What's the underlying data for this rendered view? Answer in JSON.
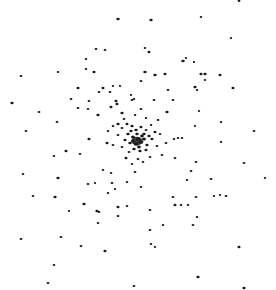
{
  "image": {
    "width": 276,
    "height": 290,
    "background": "#ffffff",
    "dot_color": "#1a1a1a",
    "description": "Star cluster, dense core near center"
  },
  "core": {
    "cx": 137,
    "cy": 141,
    "rx": 16,
    "ry": 12
  },
  "stars": [
    [
      118,
      19,
      1.6
    ],
    [
      96,
      49,
      1.3
    ],
    [
      105,
      50,
      1.3
    ],
    [
      86,
      59,
      1.2
    ],
    [
      86,
      69,
      1.2
    ],
    [
      94,
      72,
      1.4
    ],
    [
      21,
      76,
      1.3
    ],
    [
      58,
      72,
      1.2
    ],
    [
      78,
      88,
      1.4
    ],
    [
      103,
      88,
      1.4
    ],
    [
      113,
      86,
      1.1
    ],
    [
      120,
      86,
      1.1
    ],
    [
      71,
      99,
      1.3
    ],
    [
      89,
      101,
      1.3
    ],
    [
      99,
      92,
      1.3
    ],
    [
      110,
      92,
      1.3
    ],
    [
      116,
      101,
      1.4
    ],
    [
      12,
      103,
      1.5
    ],
    [
      39,
      112,
      1.3
    ],
    [
      88,
      109,
      1.2
    ],
    [
      78,
      108,
      1.3
    ],
    [
      98,
      115,
      1.5
    ],
    [
      117,
      104,
      1.4
    ],
    [
      111,
      107,
      1.4
    ],
    [
      122,
      113,
      1.5
    ],
    [
      57,
      122,
      1.3
    ],
    [
      26,
      131,
      1.3
    ],
    [
      118,
      124,
      1.5
    ],
    [
      89,
      139,
      1.4
    ],
    [
      107,
      143,
      1.4
    ],
    [
      132,
      100,
      1.3
    ],
    [
      134,
      99,
      1.2
    ],
    [
      131,
      95,
      1.1
    ],
    [
      239,
      1,
      1.3
    ],
    [
      151,
      20,
      1.5
    ],
    [
      201,
      17,
      1.2
    ],
    [
      231,
      38,
      1.1
    ],
    [
      145,
      48,
      1.2
    ],
    [
      149,
      52,
      1.4
    ],
    [
      183,
      61,
      1.6
    ],
    [
      186,
      58,
      1.1
    ],
    [
      194,
      62,
      1.1
    ],
    [
      145,
      72,
      1.6
    ],
    [
      155,
      75,
      1.6
    ],
    [
      165,
      74,
      1.4
    ],
    [
      201,
      74,
      1.4
    ],
    [
      205,
      74,
      1.5
    ],
    [
      220,
      75,
      1.4
    ],
    [
      205,
      80,
      1.1
    ],
    [
      195,
      87,
      1.5
    ],
    [
      197,
      90,
      1.2
    ],
    [
      233,
      88,
      1.4
    ],
    [
      141,
      81,
      1.3
    ],
    [
      168,
      90,
      1.3
    ],
    [
      154,
      100,
      1.3
    ],
    [
      173,
      100,
      1.3
    ],
    [
      167,
      112,
      1.5
    ],
    [
      199,
      111,
      1.1
    ],
    [
      221,
      122,
      1.2
    ],
    [
      195,
      126,
      1.1
    ],
    [
      254,
      131,
      1.3
    ],
    [
      221,
      142,
      1.2
    ],
    [
      174,
      139,
      1.2
    ],
    [
      178,
      138,
      1.2
    ],
    [
      182,
      138,
      1.2
    ],
    [
      141,
      109,
      1.3
    ],
    [
      66,
      151,
      1.4
    ],
    [
      54,
      156,
      1.2
    ],
    [
      80,
      154,
      1.2
    ],
    [
      23,
      174,
      1.2
    ],
    [
      58,
      178,
      1.5
    ],
    [
      33,
      196,
      1.2
    ],
    [
      55,
      197,
      1.5
    ],
    [
      103,
      170,
      1.2
    ],
    [
      111,
      173,
      1.2
    ],
    [
      88,
      184,
      1.3
    ],
    [
      95,
      183,
      1.1
    ],
    [
      108,
      193,
      1.2
    ],
    [
      97,
      211,
      1.5
    ],
    [
      84,
      204,
      1.5
    ],
    [
      99,
      212,
      1.3
    ],
    [
      69,
      211,
      1.1
    ],
    [
      118,
      207,
      1.4
    ],
    [
      127,
      206,
      1.2
    ],
    [
      118,
      216,
      1.3
    ],
    [
      98,
      223,
      1.2
    ],
    [
      21,
      239,
      1.3
    ],
    [
      61,
      237,
      1.3
    ],
    [
      81,
      246,
      1.3
    ],
    [
      105,
      251,
      1.4
    ],
    [
      54,
      265,
      1.2
    ],
    [
      48,
      283,
      1.3
    ],
    [
      134,
      286,
      1.3
    ],
    [
      135,
      172,
      1.3
    ],
    [
      127,
      182,
      1.2
    ],
    [
      115,
      189,
      1.1
    ],
    [
      112,
      183,
      1.3
    ],
    [
      175,
      158,
      1.3
    ],
    [
      196,
      162,
      1.3
    ],
    [
      244,
      163,
      1.3
    ],
    [
      191,
      171,
      1.3
    ],
    [
      211,
      179,
      1.3
    ],
    [
      187,
      180,
      1.2
    ],
    [
      265,
      178,
      1.1
    ],
    [
      173,
      197,
      1.3
    ],
    [
      196,
      197,
      1.3
    ],
    [
      226,
      196,
      1.3
    ],
    [
      141,
      187,
      1.2
    ],
    [
      175,
      205,
      1.4
    ],
    [
      181,
      205,
      1.3
    ],
    [
      188,
      205,
      1.2
    ],
    [
      150,
      210,
      1.3
    ],
    [
      214,
      196,
      1.1
    ],
    [
      220,
      195,
      1.1
    ],
    [
      197,
      217,
      1.2
    ],
    [
      163,
      225,
      1.2
    ],
    [
      193,
      225,
      1.3
    ],
    [
      150,
      230,
      1.3
    ],
    [
      151,
      244,
      1.2
    ],
    [
      155,
      247,
      1.1
    ],
    [
      239,
      247,
      1.4
    ],
    [
      198,
      277,
      1.5
    ],
    [
      244,
      288,
      1.5
    ],
    [
      122,
      128,
      1.3
    ],
    [
      127,
      124,
      1.4
    ],
    [
      132,
      126,
      1.5
    ],
    [
      136,
      130,
      1.6
    ],
    [
      141,
      127,
      1.4
    ],
    [
      146,
      130,
      1.3
    ],
    [
      151,
      125,
      1.2
    ],
    [
      155,
      132,
      1.4
    ],
    [
      128,
      134,
      1.6
    ],
    [
      133,
      137,
      1.8
    ],
    [
      138,
      139,
      2.0
    ],
    [
      141,
      142,
      2.2
    ],
    [
      136,
      144,
      2.0
    ],
    [
      144,
      139,
      1.8
    ],
    [
      130,
      143,
      1.6
    ],
    [
      147,
      145,
      1.5
    ],
    [
      125,
      140,
      1.4
    ],
    [
      152,
      139,
      1.4
    ],
    [
      134,
      149,
      1.6
    ],
    [
      140,
      151,
      1.5
    ],
    [
      146,
      150,
      1.4
    ],
    [
      129,
      152,
      1.3
    ],
    [
      122,
      147,
      1.3
    ],
    [
      157,
      146,
      1.3
    ],
    [
      118,
      135,
      1.3
    ],
    [
      160,
      134,
      1.2
    ],
    [
      126,
      158,
      1.4
    ],
    [
      138,
      159,
      1.3
    ],
    [
      150,
      157,
      1.3
    ],
    [
      143,
      162,
      1.2
    ],
    [
      132,
      164,
      1.2
    ],
    [
      162,
      155,
      1.3
    ],
    [
      113,
      145,
      1.3
    ],
    [
      113,
      126,
      1.2
    ],
    [
      158,
      120,
      1.3
    ],
    [
      146,
      118,
      1.2
    ],
    [
      135,
      115,
      1.2
    ],
    [
      124,
      119,
      1.3
    ],
    [
      166,
      143,
      1.3
    ],
    [
      108,
      131,
      1.2
    ],
    [
      144,
      134,
      1.6
    ],
    [
      137,
      134,
      1.6
    ],
    [
      131,
      131,
      1.5
    ],
    [
      149,
      136,
      1.5
    ],
    [
      139,
      147,
      1.7
    ],
    [
      133,
      141,
      1.8
    ],
    [
      142,
      136,
      1.7
    ]
  ]
}
